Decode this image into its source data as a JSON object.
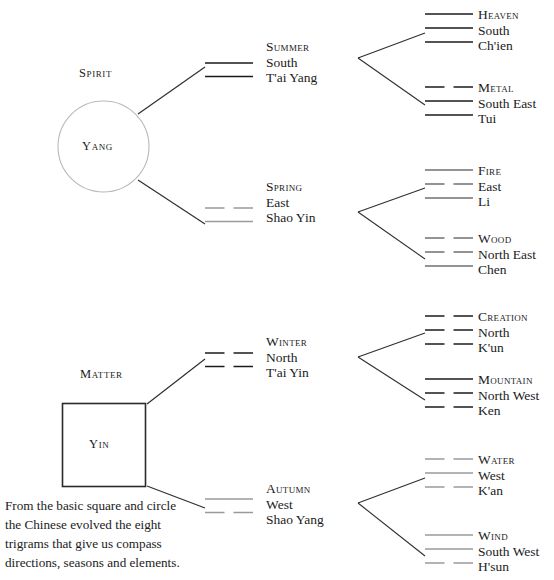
{
  "diagram": {
    "title_caption": [
      "From the basic square and circle",
      "the Chinese evolved the eight",
      "trigrams that give us compass",
      "directions, seasons and elements."
    ],
    "roots": [
      {
        "name": "spirit",
        "heading": "Spirit",
        "shape": "circle",
        "shape_label": "Yang"
      },
      {
        "name": "matter",
        "heading": "Matter",
        "shape": "square",
        "shape_label": "Yin"
      }
    ],
    "seasons": [
      {
        "key": "summer",
        "name": "Summer",
        "direction": "South",
        "chinese": "T'ai Yang",
        "lines": [
          "solid",
          "solid"
        ],
        "tone": "dark"
      },
      {
        "key": "spring",
        "name": "Spring",
        "direction": "East",
        "chinese": "Shao Yin",
        "lines": [
          "broken",
          "solid"
        ],
        "tone": "faded"
      },
      {
        "key": "winter",
        "name": "Winter",
        "direction": "North",
        "chinese": "T'ai Yin",
        "lines": [
          "broken",
          "broken"
        ],
        "tone": "dark"
      },
      {
        "key": "autumn",
        "name": "Autumn",
        "direction": "West",
        "chinese": "Shao Yang",
        "lines": [
          "solid",
          "broken"
        ],
        "tone": "faded"
      }
    ],
    "trigrams": [
      {
        "key": "heaven",
        "name": "Heaven",
        "direction": "South",
        "chinese": "Ch'ien",
        "lines": [
          "solid",
          "solid",
          "solid"
        ],
        "tone": "dark"
      },
      {
        "key": "metal",
        "name": "Metal",
        "direction": "South East",
        "chinese": "Tui",
        "lines": [
          "broken",
          "solid",
          "solid"
        ],
        "tone": "dark"
      },
      {
        "key": "fire",
        "name": "Fire",
        "direction": "East",
        "chinese": "Li",
        "lines": [
          "solid",
          "broken",
          "solid"
        ],
        "tone": "midfade"
      },
      {
        "key": "wood",
        "name": "Wood",
        "direction": "North East",
        "chinese": "Chen",
        "lines": [
          "broken",
          "broken",
          "solid"
        ],
        "tone": "midfade"
      },
      {
        "key": "creation",
        "name": "Creation",
        "direction": "North",
        "chinese": "K'un",
        "lines": [
          "broken",
          "broken",
          "broken"
        ],
        "tone": "dark"
      },
      {
        "key": "mountain",
        "name": "Mountain",
        "direction": "North West",
        "chinese": "Ken",
        "lines": [
          "solid",
          "broken",
          "broken"
        ],
        "tone": "dark"
      },
      {
        "key": "water",
        "name": "Water",
        "direction": "West",
        "chinese": "K'an",
        "lines": [
          "broken",
          "solid",
          "broken"
        ],
        "tone": "faded"
      },
      {
        "key": "wind",
        "name": "Wind",
        "direction": "South West",
        "chinese": "H'sun",
        "lines": [
          "solid",
          "solid",
          "broken"
        ],
        "tone": "faded"
      }
    ],
    "colors": {
      "ink": "#1b1b1b",
      "faded": "#9a9a9a",
      "midfade": "#6f6f6f",
      "circle_stroke": "#b9b9b9",
      "square_stroke": "#2a2a2a",
      "connector": "#2f2f2f"
    }
  }
}
